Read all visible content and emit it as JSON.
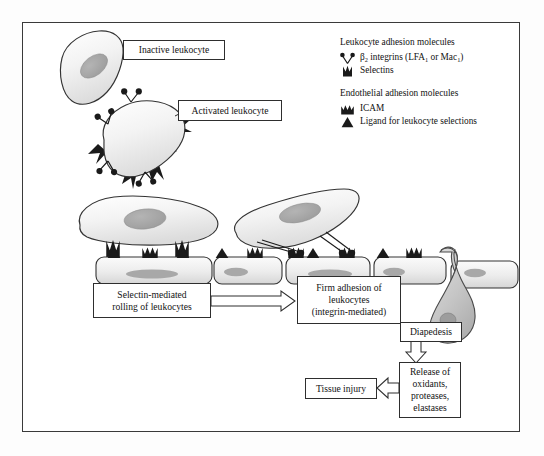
{
  "figure": {
    "type": "biological-process-diagram"
  },
  "callouts": {
    "inactive_leukocyte": "Inactive leukocyte",
    "activated_leukocyte": "Activated leukocyte"
  },
  "legend": {
    "leukocyte_heading": "Leukocyte adhesion molecules",
    "endothelial_heading": "Endothelial adhesion molecules",
    "items": [
      {
        "icon": "beta2-integrin-icon",
        "label_pre": "β",
        "label_sub": "2",
        "label_mid": " integrins (LFA",
        "label_sub2": "1",
        "label_mid2": " or Mac",
        "label_sub3": "1",
        "label_end": ")"
      },
      {
        "icon": "selectin-icon",
        "label": "Selectins"
      },
      {
        "icon": "icam-icon",
        "label": "ICAM"
      },
      {
        "icon": "ligand-icon",
        "label": "Ligand for leukocyte selections"
      }
    ],
    "beta2_integrins_plain": "β2 integrins (LFA1 or Mac1)",
    "selectins_plain": "Selectins",
    "icam_plain": "ICAM",
    "ligand_plain": "Ligand for leukocyte selections"
  },
  "steps": {
    "rolling": {
      "line1": "Selectin-mediated",
      "line2": "rolling of leukocytes"
    },
    "firm_adhesion": {
      "line1": "Firm adhesion of",
      "line2": "leukocytes",
      "line3": "(integrin-mediated)"
    },
    "diapedesis": {
      "line1": "Diapedesis"
    },
    "release": {
      "line1": "Release of",
      "line2": "oxidants,",
      "line3": "proteases,",
      "line4": "elastases"
    },
    "tissue_injury": {
      "line1": "Tissue injury"
    }
  },
  "colors": {
    "outline": "#2e2e2e",
    "cell_fill_light": "#f4f4f4",
    "cell_fill_mid": "#e3e3e3",
    "nucleus": "#a6a6a6",
    "molecule_black": "#1a1a1a",
    "diapedesis_cell": "#c9c9c9",
    "frame": "#3a3a3a",
    "background": "#ffffff"
  }
}
